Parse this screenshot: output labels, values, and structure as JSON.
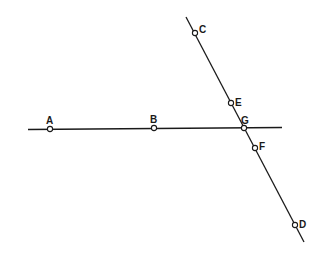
{
  "diagram": {
    "colors": {
      "line": "#1a1a1a",
      "background": "#ffffff",
      "point_fill": "#ffffff"
    },
    "lines": [
      {
        "id": "line-AB",
        "x1": 28,
        "y1": 129.5,
        "x2": 282,
        "y2": 127.5
      },
      {
        "id": "line-CD",
        "x1": 186,
        "y1": 17,
        "x2": 304,
        "y2": 242
      }
    ],
    "points": [
      {
        "name": "A",
        "label": "A",
        "x": 50,
        "y": 129,
        "lx": 46,
        "ly": 124
      },
      {
        "name": "B",
        "label": "B",
        "x": 154,
        "y": 128,
        "lx": 150,
        "ly": 123
      },
      {
        "name": "C",
        "label": "C",
        "x": 195,
        "y": 33,
        "lx": 199,
        "ly": 33
      },
      {
        "name": "E",
        "label": "E",
        "x": 231,
        "y": 103,
        "lx": 235,
        "ly": 106
      },
      {
        "name": "G",
        "label": "G",
        "x": 244,
        "y": 128,
        "lx": 241,
        "ly": 124
      },
      {
        "name": "F",
        "label": "F",
        "x": 255,
        "y": 148,
        "lx": 259,
        "ly": 150
      },
      {
        "name": "D",
        "label": "D",
        "x": 295,
        "y": 225,
        "lx": 299,
        "ly": 228
      }
    ]
  }
}
